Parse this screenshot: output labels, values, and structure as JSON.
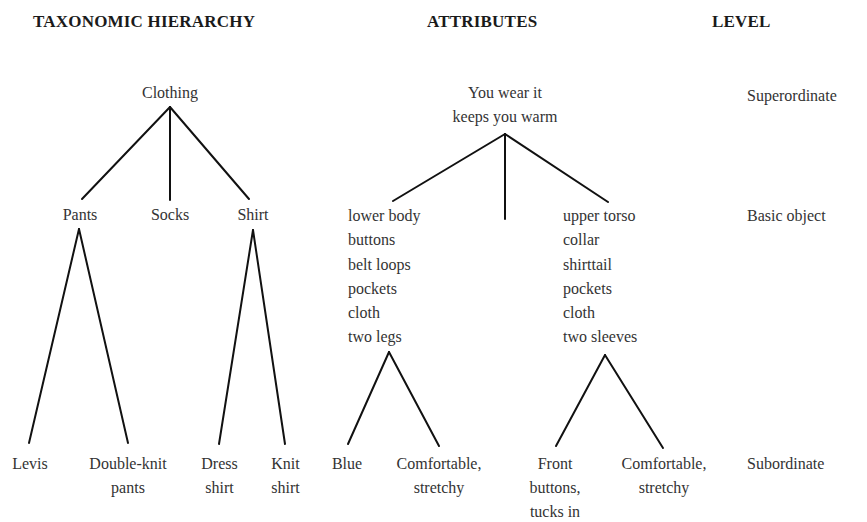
{
  "headers": {
    "taxonomy": "TAXONOMIC HIERARCHY",
    "attributes": "ATTRIBUTES",
    "level": "LEVEL"
  },
  "taxonomy": {
    "superordinate": "Clothing",
    "basic": [
      "Pants",
      "Socks",
      "Shirt"
    ],
    "subordinate": {
      "pants": [
        [
          "Levis"
        ],
        [
          "Double-knit",
          "pants"
        ]
      ],
      "shirt": [
        [
          "Dress",
          "shirt"
        ],
        [
          "Knit",
          "shirt"
        ]
      ]
    }
  },
  "attributes": {
    "superordinate": [
      "You wear it",
      "keeps you warm"
    ],
    "basic": {
      "pants": [
        "lower body",
        "buttons",
        "belt loops",
        "pockets",
        "cloth",
        "two legs"
      ],
      "shirt": [
        "upper torso",
        "collar",
        "shirttail",
        "pockets",
        "cloth",
        "two sleeves"
      ]
    },
    "subordinate": {
      "pants": [
        [
          "Blue"
        ],
        [
          "Comfortable,",
          "stretchy"
        ]
      ],
      "shirt": [
        [
          "Front",
          "buttons,",
          "tucks in"
        ],
        [
          "Comfortable,",
          "stretchy"
        ]
      ]
    }
  },
  "levels": [
    "Superordinate",
    "Basic object",
    "Subordinate"
  ]
}
